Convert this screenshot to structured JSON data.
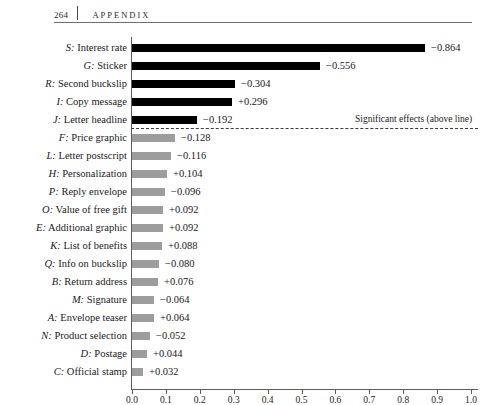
{
  "page": {
    "folio": "264",
    "running_title": "APPENDIX"
  },
  "annotation": {
    "significance_note": "Significant effects (above line)"
  },
  "chart_data": {
    "type": "bar",
    "orientation": "horizontal",
    "title": "",
    "xlabel": "Effect in percentage points",
    "ylabel": "",
    "xlim": [
      0.0,
      1.0
    ],
    "grid": false,
    "legend": null,
    "tick_labels": [
      "0.0",
      "0.1",
      "0.2",
      "0.3",
      "0.4",
      "0.5",
      "0.6",
      "0.7",
      "0.8",
      "0.9",
      "1.0"
    ],
    "ticks": [
      0.0,
      0.1,
      0.2,
      0.3,
      0.4,
      0.5,
      0.6,
      0.7,
      0.8,
      0.9,
      1.0
    ],
    "colors": {
      "significant": "#000000",
      "not_significant": "#9d9d9d",
      "axis": "#5d5d5d"
    },
    "significance_divider_after_index": 4,
    "categories": [
      "S: Interest rate",
      "G: Sticker",
      "R: Second buckslip",
      "I: Copy message",
      "J: Letter headline",
      "F: Price graphic",
      "L: Letter postscript",
      "H: Personalization",
      "P: Reply envelope",
      "O: Value of free gift",
      "E: Additional graphic",
      "K: List of benefits",
      "Q: Info on buckslip",
      "B: Return address",
      "M: Signature",
      "A: Envelope teaser",
      "N: Product selection",
      "D: Postage",
      "C: Official stamp"
    ],
    "values": [
      -0.864,
      -0.556,
      -0.304,
      0.296,
      -0.192,
      -0.128,
      -0.116,
      0.104,
      -0.096,
      0.092,
      0.092,
      0.088,
      -0.08,
      0.076,
      -0.064,
      0.064,
      -0.052,
      0.044,
      0.032
    ],
    "bars": [
      {
        "key": "S",
        "name": "Interest rate",
        "label": "S: Interest rate",
        "value": -0.864,
        "magnitude": 0.864,
        "value_label": "−0.864",
        "significant": true
      },
      {
        "key": "G",
        "name": "Sticker",
        "label": "G: Sticker",
        "value": -0.556,
        "magnitude": 0.556,
        "value_label": "−0.556",
        "significant": true
      },
      {
        "key": "R",
        "name": "Second buckslip",
        "label": "R: Second buckslip",
        "value": -0.304,
        "magnitude": 0.304,
        "value_label": "−0.304",
        "significant": true
      },
      {
        "key": "I",
        "name": "Copy message",
        "label": "I: Copy message",
        "value": 0.296,
        "magnitude": 0.296,
        "value_label": "+0.296",
        "significant": true
      },
      {
        "key": "J",
        "name": "Letter headline",
        "label": "J: Letter headline",
        "value": -0.192,
        "magnitude": 0.192,
        "value_label": "−0.192",
        "significant": true
      },
      {
        "key": "F",
        "name": "Price graphic",
        "label": "F: Price graphic",
        "value": -0.128,
        "magnitude": 0.128,
        "value_label": "−0.128",
        "significant": false
      },
      {
        "key": "L",
        "name": "Letter postscript",
        "label": "L: Letter postscript",
        "value": -0.116,
        "magnitude": 0.116,
        "value_label": "−0.116",
        "significant": false
      },
      {
        "key": "H",
        "name": "Personalization",
        "label": "H: Personalization",
        "value": 0.104,
        "magnitude": 0.104,
        "value_label": "+0.104",
        "significant": false
      },
      {
        "key": "P",
        "name": "Reply envelope",
        "label": "P: Reply envelope",
        "value": -0.096,
        "magnitude": 0.096,
        "value_label": "−0.096",
        "significant": false
      },
      {
        "key": "O",
        "name": "Value of free gift",
        "label": "O: Value of free gift",
        "value": 0.092,
        "magnitude": 0.092,
        "value_label": "+0.092",
        "significant": false
      },
      {
        "key": "E",
        "name": "Additional graphic",
        "label": "E: Additional graphic",
        "value": 0.092,
        "magnitude": 0.092,
        "value_label": "+0.092",
        "significant": false
      },
      {
        "key": "K",
        "name": "List of benefits",
        "label": "K: List of benefits",
        "value": 0.088,
        "magnitude": 0.088,
        "value_label": "+0.088",
        "significant": false
      },
      {
        "key": "Q",
        "name": "Info on buckslip",
        "label": "Q: Info on buckslip",
        "value": -0.08,
        "magnitude": 0.08,
        "value_label": "−0.080",
        "significant": false
      },
      {
        "key": "B",
        "name": "Return address",
        "label": "B: Return address",
        "value": 0.076,
        "magnitude": 0.076,
        "value_label": "+0.076",
        "significant": false
      },
      {
        "key": "M",
        "name": "Signature",
        "label": "M: Signature",
        "value": -0.064,
        "magnitude": 0.064,
        "value_label": "−0.064",
        "significant": false
      },
      {
        "key": "A",
        "name": "Envelope teaser",
        "label": "A: Envelope teaser",
        "value": 0.064,
        "magnitude": 0.064,
        "value_label": "+0.064",
        "significant": false
      },
      {
        "key": "N",
        "name": "Product selection",
        "label": "N: Product selection",
        "value": -0.052,
        "magnitude": 0.052,
        "value_label": "−0.052",
        "significant": false
      },
      {
        "key": "D",
        "name": "Postage",
        "label": "D: Postage",
        "value": 0.044,
        "magnitude": 0.044,
        "value_label": "+0.044",
        "significant": false
      },
      {
        "key": "C",
        "name": "Official stamp",
        "label": "C: Official stamp",
        "value": 0.032,
        "magnitude": 0.032,
        "value_label": "+0.032",
        "significant": false
      }
    ]
  }
}
